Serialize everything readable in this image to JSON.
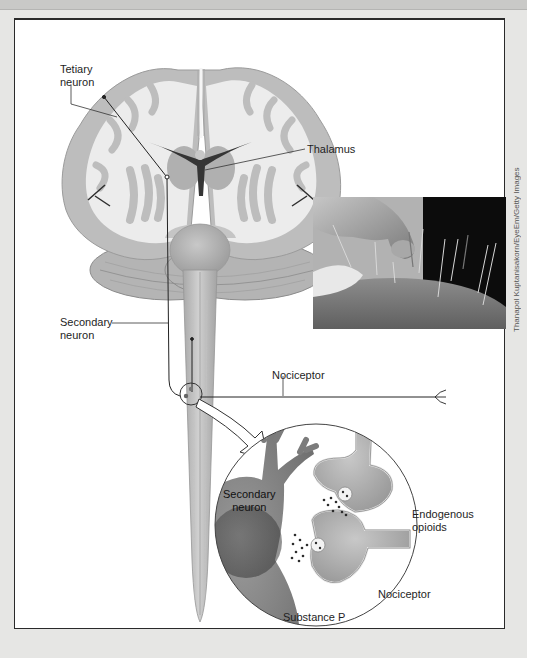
{
  "figure": {
    "labels": {
      "tertiary_neuron": [
        "Tetiary",
        "neuron"
      ],
      "thalamus": "Thalamus",
      "secondary_neuron": [
        "Secondary",
        "neuron"
      ],
      "nociceptor_top": "Nociceptor",
      "inset_secondary_neuron": [
        "Secondary",
        "neuron"
      ],
      "endogenous_opioids": [
        "Endogenous",
        "opioids"
      ],
      "inset_nociceptor": "Nociceptor",
      "substance_p": "Substance P"
    },
    "photo_credit": "Thanapol Kuptanisakorn/EyeEm/Getty Images",
    "photo_description": "acupuncture-needles-in-skin"
  },
  "colors": {
    "page_background": "#e6e6e4",
    "frame_border": "#2a2a2a",
    "brain_white_matter": "#e9e9e9",
    "brain_gray_matter": "#bdbdbd",
    "ventricle": "#3a3a3a",
    "spinal_cord": "#b9b9b9",
    "label_text": "#1e1e1e"
  }
}
